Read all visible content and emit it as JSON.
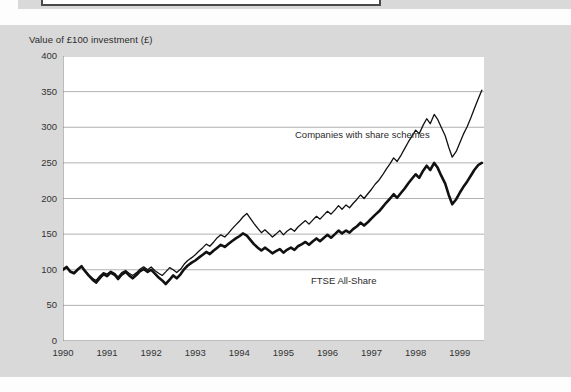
{
  "figure": {
    "y_axis_title": "Value of £100 investment (£)",
    "series_labels": {
      "companies": "Companies with share schemes",
      "ftse": "FTSE All-Share"
    },
    "colors": {
      "background": "#d9d9d9",
      "plot_background": "#ffffff",
      "gridline": "#a8a8a8",
      "axis": "#7a7a7a",
      "line": "#111111",
      "text": "#2b2b2b"
    }
  },
  "chart_data": {
    "type": "line",
    "title": "",
    "subtitle": "",
    "xlabel": "",
    "ylabel": "Value of £100 investment (£)",
    "xlim": [
      1990,
      1999.55
    ],
    "ylim": [
      0,
      400
    ],
    "yticks": [
      0,
      50,
      100,
      150,
      200,
      250,
      300,
      350,
      400
    ],
    "xticks": [
      1990,
      1991,
      1992,
      1993,
      1994,
      1995,
      1996,
      1997,
      1998,
      1999
    ],
    "xtick_labels": [
      "1990",
      "1991",
      "1992",
      "1993",
      "1994",
      "1995",
      "1996",
      "1997",
      "1998",
      "1999"
    ],
    "ytick_labels": [
      "0",
      "50",
      "100",
      "150",
      "200",
      "250",
      "300",
      "350",
      "400"
    ],
    "grid": "horizontal",
    "legend": "inline-annotations",
    "annotations": [
      {
        "text": "Companies with share schemes",
        "x": 1995.9,
        "y": 312
      },
      {
        "text": "FTSE All-Share",
        "x": 1996.3,
        "y": 135
      }
    ],
    "series": [
      {
        "name": "Companies with share schemes",
        "line_width": 1.3,
        "x": [
          1990.0,
          1990.08,
          1990.17,
          1990.25,
          1990.33,
          1990.42,
          1990.5,
          1990.58,
          1990.67,
          1990.75,
          1990.83,
          1990.92,
          1991.0,
          1991.08,
          1991.17,
          1991.25,
          1991.33,
          1991.42,
          1991.5,
          1991.58,
          1991.67,
          1991.75,
          1991.83,
          1991.92,
          1992.0,
          1992.08,
          1992.17,
          1992.25,
          1992.33,
          1992.42,
          1992.5,
          1992.58,
          1992.67,
          1992.75,
          1992.83,
          1992.92,
          1993.0,
          1993.08,
          1993.17,
          1993.25,
          1993.33,
          1993.42,
          1993.5,
          1993.58,
          1993.67,
          1993.75,
          1993.83,
          1993.92,
          1994.0,
          1994.08,
          1994.17,
          1994.25,
          1994.33,
          1994.42,
          1994.5,
          1994.58,
          1994.67,
          1994.75,
          1994.83,
          1994.92,
          1995.0,
          1995.08,
          1995.17,
          1995.25,
          1995.33,
          1995.42,
          1995.5,
          1995.58,
          1995.67,
          1995.75,
          1995.83,
          1995.92,
          1996.0,
          1996.08,
          1996.17,
          1996.25,
          1996.33,
          1996.42,
          1996.5,
          1996.58,
          1996.67,
          1996.75,
          1996.83,
          1996.92,
          1997.0,
          1997.08,
          1997.17,
          1997.25,
          1997.33,
          1997.42,
          1997.5,
          1997.58,
          1997.67,
          1997.75,
          1997.83,
          1997.92,
          1998.0,
          1998.08,
          1998.17,
          1998.25,
          1998.33,
          1998.42,
          1998.5,
          1998.58,
          1998.67,
          1998.75,
          1998.83,
          1998.92,
          1999.0,
          1999.08,
          1999.17,
          1999.25,
          1999.33,
          1999.42,
          1999.5
        ],
        "y": [
          100,
          103,
          98,
          96,
          101,
          104,
          99,
          93,
          88,
          85,
          91,
          96,
          94,
          98,
          95,
          90,
          96,
          99,
          95,
          92,
          96,
          101,
          104,
          100,
          104,
          99,
          95,
          92,
          97,
          103,
          100,
          96,
          101,
          108,
          113,
          117,
          121,
          126,
          131,
          136,
          133,
          139,
          145,
          149,
          146,
          151,
          157,
          163,
          168,
          174,
          179,
          172,
          165,
          158,
          152,
          156,
          151,
          146,
          150,
          155,
          149,
          154,
          158,
          154,
          160,
          165,
          169,
          164,
          170,
          175,
          171,
          177,
          182,
          178,
          184,
          190,
          185,
          191,
          187,
          193,
          199,
          205,
          200,
          207,
          213,
          220,
          226,
          233,
          241,
          249,
          257,
          252,
          261,
          270,
          279,
          288,
          296,
          291,
          303,
          312,
          305,
          318,
          311,
          300,
          288,
          272,
          258,
          266,
          278,
          290,
          301,
          313,
          326,
          340,
          352
        ]
      },
      {
        "name": "FTSE All-Share",
        "line_width": 2.6,
        "x": [
          1990.0,
          1990.08,
          1990.17,
          1990.25,
          1990.33,
          1990.42,
          1990.5,
          1990.58,
          1990.67,
          1990.75,
          1990.83,
          1990.92,
          1991.0,
          1991.08,
          1991.17,
          1991.25,
          1991.33,
          1991.42,
          1991.5,
          1991.58,
          1991.67,
          1991.75,
          1991.83,
          1991.92,
          1992.0,
          1992.08,
          1992.17,
          1992.25,
          1992.33,
          1992.42,
          1992.5,
          1992.58,
          1992.67,
          1992.75,
          1992.83,
          1992.92,
          1993.0,
          1993.08,
          1993.17,
          1993.25,
          1993.33,
          1993.42,
          1993.5,
          1993.58,
          1993.67,
          1993.75,
          1993.83,
          1993.92,
          1994.0,
          1994.08,
          1994.17,
          1994.25,
          1994.33,
          1994.42,
          1994.5,
          1994.58,
          1994.67,
          1994.75,
          1994.83,
          1994.92,
          1995.0,
          1995.08,
          1995.17,
          1995.25,
          1995.33,
          1995.42,
          1995.5,
          1995.58,
          1995.67,
          1995.75,
          1995.83,
          1995.92,
          1996.0,
          1996.08,
          1996.17,
          1996.25,
          1996.33,
          1996.42,
          1996.5,
          1996.58,
          1996.67,
          1996.75,
          1996.83,
          1996.92,
          1997.0,
          1997.08,
          1997.17,
          1997.25,
          1997.33,
          1997.42,
          1997.5,
          1997.58,
          1997.67,
          1997.75,
          1997.83,
          1997.92,
          1998.0,
          1998.08,
          1998.17,
          1998.25,
          1998.33,
          1998.42,
          1998.5,
          1998.58,
          1998.67,
          1998.75,
          1998.83,
          1998.92,
          1999.0,
          1999.08,
          1999.17,
          1999.25,
          1999.33,
          1999.42,
          1999.5
        ],
        "y": [
          100,
          104,
          97,
          95,
          100,
          105,
          98,
          92,
          86,
          82,
          88,
          94,
          91,
          96,
          93,
          87,
          93,
          97,
          92,
          88,
          93,
          98,
          101,
          97,
          100,
          95,
          89,
          85,
          80,
          86,
          92,
          88,
          94,
          101,
          106,
          110,
          113,
          117,
          121,
          125,
          122,
          127,
          131,
          135,
          132,
          136,
          140,
          144,
          147,
          151,
          148,
          142,
          136,
          131,
          127,
          131,
          127,
          123,
          126,
          129,
          124,
          128,
          131,
          128,
          133,
          136,
          139,
          135,
          140,
          144,
          140,
          145,
          149,
          145,
          150,
          155,
          151,
          155,
          152,
          157,
          161,
          166,
          162,
          167,
          172,
          177,
          182,
          188,
          194,
          200,
          206,
          201,
          208,
          214,
          221,
          228,
          234,
          229,
          239,
          246,
          240,
          250,
          243,
          232,
          221,
          205,
          192,
          199,
          208,
          216,
          224,
          232,
          240,
          247,
          250
        ]
      }
    ]
  }
}
